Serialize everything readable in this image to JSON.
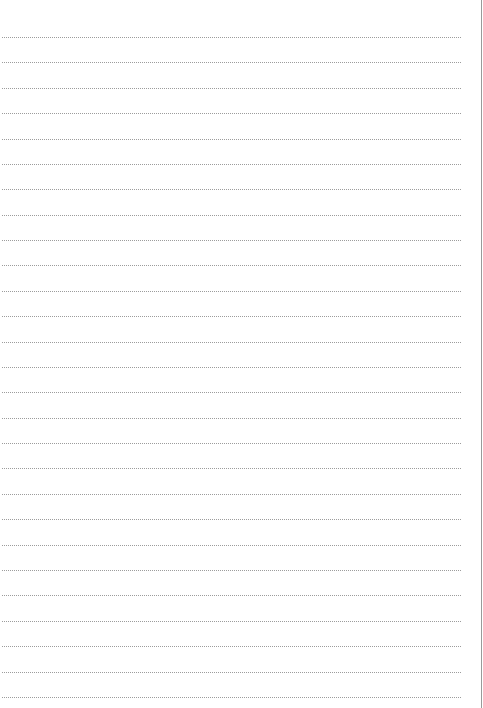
{
  "page": {
    "type": "lined-paper",
    "background": "#ffffff",
    "rule_color": "#9c9c9c",
    "edge_color": "#9a9a9a",
    "rule_style": "dotted",
    "rule_count": 27,
    "first_rule_y": 37,
    "rule_spacing": 25.38,
    "rule_left": 2,
    "rule_width": 459
  }
}
